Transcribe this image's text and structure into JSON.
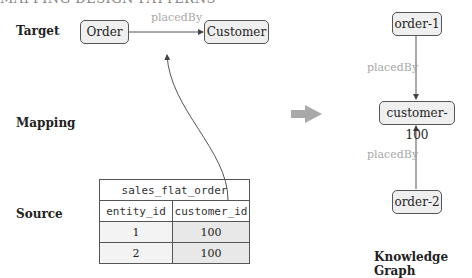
{
  "header": {
    "title_partial": "MAPPING DESIGN PATTERNS"
  },
  "row_labels": {
    "target": "Target",
    "mapping": "Mapping",
    "source": "Source"
  },
  "target": {
    "nodes": [
      "Order",
      "Customer"
    ],
    "edge_label": "placedBy"
  },
  "source_table": {
    "name": "sales_flat_order",
    "columns": [
      "entity_id",
      "customer_id"
    ],
    "rows": [
      {
        "entity_id": "1",
        "customer_id": "100"
      },
      {
        "entity_id": "2",
        "customer_id": "100"
      }
    ]
  },
  "knowledge_graph": {
    "nodes": [
      "order-1",
      "customer-100",
      "order-2"
    ],
    "edges": [
      {
        "from": "order-1",
        "to": "customer-100",
        "label": "placedBy"
      },
      {
        "from": "order-2",
        "to": "customer-100",
        "label": "placedBy"
      }
    ],
    "caption": "Knowledge Graph"
  },
  "colors": {
    "arrow": "#a9a9a9",
    "edge_label": "#a8a8a8",
    "node_fill": "#efefef",
    "stroke": "#555555"
  }
}
